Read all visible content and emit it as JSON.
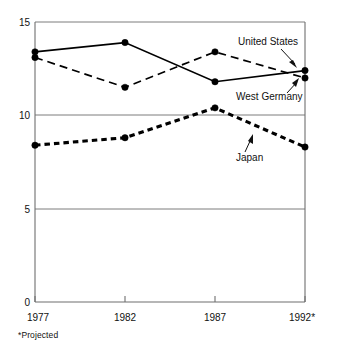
{
  "chart_data": {
    "type": "line",
    "title": "",
    "subtitle": "",
    "xlabel": "",
    "ylabel": "",
    "categories": [
      "1977",
      "1982",
      "1987",
      "1992*"
    ],
    "x_tick_labels": [
      "1977",
      "1982",
      "1987",
      "1992*"
    ],
    "y_tick_labels": [
      "15",
      "10",
      "5",
      "0"
    ],
    "y_ticks": [
      15,
      10,
      5,
      0
    ],
    "ylim": [
      0,
      15
    ],
    "grid": "horizontal",
    "legend_position": "inline-annotations",
    "series": [
      {
        "name": "United States",
        "style": "solid",
        "values": [
          13.4,
          13.9,
          11.8,
          12.4
        ]
      },
      {
        "name": "West Germany",
        "style": "dashed",
        "values": [
          13.1,
          11.5,
          13.4,
          12.0
        ]
      },
      {
        "name": "Japan",
        "style": "dotted-thick",
        "values": [
          8.4,
          8.8,
          10.4,
          8.3
        ]
      }
    ],
    "annotations": [
      {
        "label": "United States",
        "series": "United States"
      },
      {
        "label": "West Germany",
        "series": "West Germany"
      },
      {
        "label": "Japan",
        "series": "Japan"
      }
    ],
    "footnote": "*Projected"
  },
  "colors": {
    "ink": "#000000",
    "axis": "#6f6f6f",
    "grid": "#7d7d7d",
    "background": "#ffffff"
  }
}
